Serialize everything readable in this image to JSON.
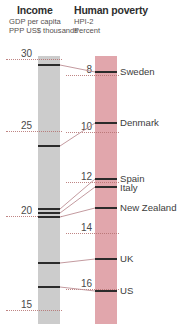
{
  "header": {
    "income_title": "Income",
    "income_subtitle": "GDP per capita\nPPP US$ thousands",
    "income_sub_line1": "GDP per capita",
    "income_sub_line2": "PPP US$ thousands",
    "poverty_title": "Human poverty",
    "poverty_sub_line1": "HPI-2",
    "poverty_sub_line2": "Percent"
  },
  "colors": {
    "income_band": "#cccccc",
    "poverty_band": "#e1a6ac",
    "gridline": "#b5706f",
    "marker": "#2b2b2b",
    "connector": "#bc8e94",
    "text": "#3a3a3a"
  },
  "chart_data": {
    "type": "line",
    "subtitle": "Slopegraph linking GDP per capita to HPI-2",
    "grid": true,
    "legend": "none",
    "axes": [
      {
        "name": "Income",
        "label": "GDP per capita PPP US$ thousands",
        "ticks": [
          30,
          25,
          20,
          15
        ],
        "range": [
          14.2,
          31.0
        ],
        "inverted": false
      },
      {
        "name": "Human poverty",
        "label": "HPI-2 Percent",
        "ticks": [
          8,
          10,
          12,
          14,
          16
        ],
        "range": [
          7.2,
          17.0
        ],
        "inverted": false
      }
    ],
    "categories": [
      "Sweden",
      "Denmark",
      "Spain",
      "Italy",
      "New Zealand",
      "UK",
      "US"
    ],
    "series": [
      {
        "name": "Income (GDP per capita, PPP US$ thousands)",
        "values": [
          29.3,
          29.9,
          20.4,
          20.2,
          20.0,
          24.0,
          31.0
        ]
      },
      {
        "name": "Human poverty (HPI-2, percent)",
        "values": [
          7.8,
          9.6,
          12.0,
          12.3,
          12.9,
          15.2,
          16.4
        ]
      }
    ],
    "points": [
      {
        "label": "Sweden",
        "income": 29.3,
        "poverty": 7.8
      },
      {
        "label": "Denmark",
        "income": 29.9,
        "poverty": 9.6
      },
      {
        "label": "Spain",
        "income": 20.4,
        "poverty": 12.0
      },
      {
        "label": "Italy",
        "income": 20.2,
        "poverty": 12.3
      },
      {
        "label": "New Zealand",
        "income": 20.0,
        "poverty": 12.9
      },
      {
        "label": "UK",
        "income": 24.0,
        "poverty": 15.2
      },
      {
        "label": "US",
        "income": 31.0,
        "poverty": 16.4
      }
    ]
  },
  "income_axis": {
    "ticks": [
      {
        "value": "30",
        "y": 59
      },
      {
        "value": "25",
        "y": 131
      },
      {
        "value": "20",
        "y": 216
      },
      {
        "value": "15",
        "y": 310
      }
    ]
  },
  "poverty_axis": {
    "ticks": [
      {
        "value": "8",
        "y": 75
      },
      {
        "value": "10",
        "y": 132
      },
      {
        "value": "12",
        "y": 182
      },
      {
        "value": "14",
        "y": 233
      },
      {
        "value": "16",
        "y": 289
      }
    ]
  },
  "income_markers": [
    {
      "label": "Sweden_DK_group",
      "y": 64
    },
    {
      "label": "Denmark",
      "y": 145
    },
    {
      "label": "Spain",
      "y": 208
    },
    {
      "label": "Italy",
      "y": 212
    },
    {
      "label": "New Zealand",
      "y": 216
    },
    {
      "label": "UK",
      "y": 262
    },
    {
      "label": "US",
      "y": 286
    }
  ],
  "poverty_markers": [
    {
      "label": "Sweden",
      "y": 71
    },
    {
      "label": "Denmark",
      "y": 122
    },
    {
      "label": "Spain",
      "y": 178
    },
    {
      "label": "Italy",
      "y": 186
    },
    {
      "label": "New Zealand",
      "y": 207
    },
    {
      "label": "UK",
      "y": 258
    },
    {
      "label": "US",
      "y": 290
    }
  ],
  "country_labels": [
    {
      "name": "Sweden",
      "y": 66
    },
    {
      "name": "Denmark",
      "y": 117
    },
    {
      "name": "Spain",
      "y": 173
    },
    {
      "name": "Italy",
      "y": 182
    },
    {
      "name": "New Zealand",
      "y": 202
    },
    {
      "name": "UK",
      "y": 253
    },
    {
      "name": "US",
      "y": 285
    }
  ]
}
